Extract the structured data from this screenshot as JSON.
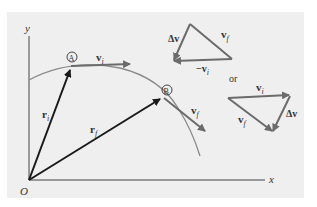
{
  "figure": {
    "axes": {
      "x_label": "x",
      "y_label": "y",
      "origin_label": "O"
    },
    "points": [
      {
        "id": "A",
        "label": "A"
      },
      {
        "id": "B",
        "label": "B"
      }
    ],
    "vectors": {
      "r_i": {
        "symbol": "r",
        "subscript": "i"
      },
      "r_f": {
        "symbol": "r",
        "subscript": "f"
      },
      "v_i": {
        "symbol": "v",
        "subscript": "i"
      },
      "v_f": {
        "symbol": "v",
        "subscript": "f"
      }
    },
    "triangle_upper": {
      "delta_v": "Δv",
      "v_f": {
        "symbol": "v",
        "subscript": "f"
      },
      "neg_v_i": {
        "symbol": "−v",
        "subscript": "i"
      }
    },
    "or_label": "or",
    "triangle_lower": {
      "v_i": {
        "symbol": "v",
        "subscript": "i"
      },
      "v_f": {
        "symbol": "v",
        "subscript": "f"
      },
      "delta_v": "Δv"
    },
    "colors": {
      "black_vector": "#1a1a1a",
      "gray_vector": "#6b6b6b",
      "curve": "#8a8a8a",
      "panel": "#efefef"
    }
  }
}
